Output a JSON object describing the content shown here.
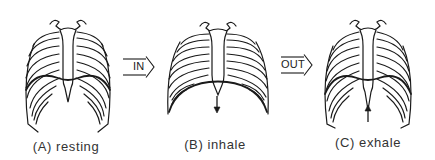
{
  "diagram": {
    "stroke_color": "#1a1a1a",
    "background": "#ffffff",
    "panels": [
      {
        "id": "A",
        "caption": "(A) resting",
        "state": "resting",
        "diaphragm_arrow": "none"
      },
      {
        "id": "B",
        "caption": "(B) inhale",
        "state": "inhale",
        "diaphragm_arrow": "down"
      },
      {
        "id": "C",
        "caption": "(C) exhale",
        "state": "exhale",
        "diaphragm_arrow": "up"
      }
    ],
    "transitions": [
      {
        "label": "IN",
        "from": "A",
        "to": "B"
      },
      {
        "label": "OUT",
        "from": "B",
        "to": "C"
      }
    ]
  }
}
